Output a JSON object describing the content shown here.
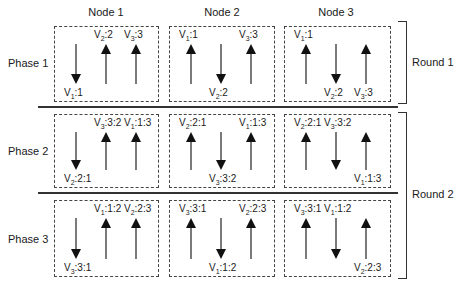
{
  "nodes": [
    "Node 1",
    "Node 2",
    "Node 3"
  ],
  "phases": [
    "Phase 1",
    "Phase 2",
    "Phase 3"
  ],
  "rounds": [
    "Round 1",
    "Round 2"
  ],
  "cells": [
    [
      {
        "arrows": [
          {
            "dir": "down",
            "var": "V",
            "sub": "1",
            "val": ":1"
          },
          {
            "dir": "up",
            "var": "V",
            "sub": "2",
            "val": ":2"
          },
          {
            "dir": "up",
            "var": "V",
            "sub": "3",
            "val": ":3"
          }
        ]
      },
      {
        "arrows": [
          {
            "dir": "up",
            "var": "V",
            "sub": "1",
            "val": ":1"
          },
          {
            "dir": "down",
            "var": "V",
            "sub": "2",
            "val": ":2"
          },
          {
            "dir": "up",
            "var": "V",
            "sub": "3",
            "val": ":3"
          }
        ]
      },
      {
        "arrows": [
          {
            "dir": "up",
            "var": "V",
            "sub": "1",
            "val": ":1"
          },
          {
            "dir": "down",
            "var": "V",
            "sub": "2",
            "val": ":2"
          },
          {
            "dir": "up",
            "var": "V",
            "sub": "3",
            "val": ":3",
            "label_pos": "bottom"
          }
        ]
      }
    ],
    [
      {
        "arrows": [
          {
            "dir": "down",
            "var": "V",
            "sub": "2",
            "val": ":2:1"
          },
          {
            "dir": "up",
            "var": "V",
            "sub": "3",
            "val": ":3:2"
          },
          {
            "dir": "up",
            "var": "V",
            "sub": "1",
            "val": ":1:3"
          }
        ]
      },
      {
        "arrows": [
          {
            "dir": "up",
            "var": "V",
            "sub": "2",
            "val": ":2:1"
          },
          {
            "dir": "down",
            "var": "V",
            "sub": "3",
            "val": ":3:2"
          },
          {
            "dir": "up",
            "var": "V",
            "sub": "1",
            "val": ":1:3"
          }
        ]
      },
      {
        "arrows": [
          {
            "dir": "up",
            "var": "V",
            "sub": "2",
            "val": ":2:1"
          },
          {
            "dir": "down",
            "var": "V",
            "sub": "3",
            "val": ":3:2",
            "label_pos": "top"
          },
          {
            "dir": "up",
            "var": "V",
            "sub": "1",
            "val": ":1:3",
            "label_pos": "bottom"
          }
        ]
      }
    ],
    [
      {
        "arrows": [
          {
            "dir": "down",
            "var": "V",
            "sub": "3",
            "val": ":3:1"
          },
          {
            "dir": "up",
            "var": "V",
            "sub": "1",
            "val": ":1:2"
          },
          {
            "dir": "up",
            "var": "V",
            "sub": "2",
            "val": ":2:3"
          }
        ]
      },
      {
        "arrows": [
          {
            "dir": "up",
            "var": "V",
            "sub": "3",
            "val": ":3:1"
          },
          {
            "dir": "down",
            "var": "V",
            "sub": "1",
            "val": ":1:2"
          },
          {
            "dir": "up",
            "var": "V",
            "sub": "2",
            "val": ":2:3"
          }
        ]
      },
      {
        "arrows": [
          {
            "dir": "up",
            "var": "V",
            "sub": "3",
            "val": ":3:1"
          },
          {
            "dir": "down",
            "var": "V",
            "sub": "1",
            "val": ":1:2",
            "label_pos": "top"
          },
          {
            "dir": "up",
            "var": "V",
            "sub": "2",
            "val": ":2:3",
            "label_pos": "bottom"
          }
        ]
      }
    ]
  ]
}
